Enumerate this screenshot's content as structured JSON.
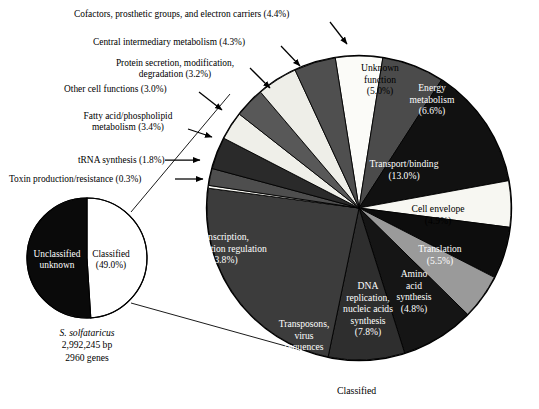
{
  "figure": {
    "background": "#ffffff",
    "bottom_caption": "Classified"
  },
  "small_pie": {
    "center": [
      87,
      258
    ],
    "radius": 60,
    "caption_lines": [
      "S. solfataricus",
      "2,992,245 bp",
      "2960 genes"
    ],
    "organism": "S. solfataricus",
    "genome_size": "2,992,245 bp",
    "gene_count": "2960 genes",
    "slices": [
      {
        "label": "Classified",
        "value_label": "(49.0%)",
        "value": 49.0,
        "color": "#ffffff",
        "text_color": "on-light",
        "label_pos": [
          111,
          249
        ]
      },
      {
        "label": "Unclassified unknown",
        "value_label": "",
        "value": 51.0,
        "color": "#0a0a0a",
        "text_color": "on-dark",
        "label_pos": [
          57,
          249
        ]
      }
    ]
  },
  "chart_data": {
    "type": "pie",
    "title": "",
    "subtitle": "",
    "legend_position": "labels-on-slices",
    "center": [
      359,
      208
    ],
    "radius": 152,
    "start_angle_deg": -9,
    "total_label": "Classified",
    "categories": [
      "Unknown function",
      "Energy metabolism",
      "Transport/binding",
      "Cell envelope",
      "Translation",
      "Amino acid synthesis",
      "DNA replication, nucleic acids synthesis",
      "Transposons, virus sequences",
      "Transcription, transcription regulation",
      "Toxin production/resistance",
      "tRNA synthesis",
      "Fatty acid/phospholipid metabolism",
      "Other cell functions",
      "Protein secretion, modification, degradation",
      "Central intermediary metabolism",
      "Cofactors, prosthetic groups, and electron carriers"
    ],
    "values": [
      5.0,
      6.6,
      13.0,
      4.9,
      5.5,
      4.8,
      7.8,
      8.1,
      23.8,
      0.3,
      1.8,
      3.4,
      3.0,
      3.2,
      4.3,
      4.4
    ],
    "value_labels": [
      "(5.0%)",
      "(6.6%)",
      "(13.0%)",
      "(4.9%)",
      "(5.5%)",
      "(4.8%)",
      "(7.8%)",
      "(8.1%)",
      "(23.8%)",
      "(0.3%)",
      "(1.8%)",
      "(3.4%)",
      "(3.0%)",
      "(3.2%)",
      "(4.3%)",
      "(4.4%)"
    ],
    "colors": [
      "#fbfbf8",
      "#4b4b4b",
      "#111111",
      "#f7f7f2",
      "#0d0d0d",
      "#9a9a9a",
      "#151515",
      "#2e2e2e",
      "#3c3c3c",
      "#f7f7f2",
      "#4e4e4e",
      "#2a2a2a",
      "#efefe9",
      "#585858",
      "#eeeee8",
      "#4f4f4f"
    ],
    "xlabel": "",
    "ylabel": ""
  },
  "inner_labels": [
    {
      "key": "unknown-function",
      "lines": [
        "Unknown",
        "function",
        "(5.0%)"
      ],
      "tone": "on-light",
      "x": 380,
      "y": 62,
      "w": 72
    },
    {
      "key": "energy-metabolism",
      "lines": [
        "Energy",
        "metabolism",
        "(6.6%)"
      ],
      "tone": "on-dark",
      "x": 432,
      "y": 82,
      "w": 70
    },
    {
      "key": "transport-binding",
      "lines": [
        "Transport/binding",
        "(13.0%)"
      ],
      "tone": "on-dark",
      "x": 404,
      "y": 158,
      "w": 112
    },
    {
      "key": "cell-envelope",
      "lines": [
        "Cell envelope",
        "(4.9%)"
      ],
      "tone": "on-light",
      "x": 438,
      "y": 203,
      "w": 84
    },
    {
      "key": "translation",
      "lines": [
        "Translation",
        "(5.5%)"
      ],
      "tone": "on-dark",
      "x": 440,
      "y": 243,
      "w": 76
    },
    {
      "key": "amino-acid-synthesis",
      "lines": [
        "Amino",
        "acid",
        "synthesis",
        "(4.8%)"
      ],
      "tone": "on-dark",
      "x": 414,
      "y": 268,
      "w": 62
    },
    {
      "key": "dna-replication",
      "lines": [
        "DNA",
        "replication,",
        "nucleic acids",
        "synthesis",
        "(7.8%)"
      ],
      "tone": "on-dark",
      "x": 368,
      "y": 280,
      "w": 72
    },
    {
      "key": "transposons-virus",
      "lines": [
        "Transposons,",
        "virus",
        "sequences",
        "(8.1%)"
      ],
      "tone": "on-dark",
      "x": 304,
      "y": 318,
      "w": 70
    },
    {
      "key": "transcription",
      "lines": [
        "Transcription,",
        "transcription regulation",
        "(23.8%)"
      ],
      "tone": "on-dark",
      "x": 222,
      "y": 231,
      "w": 128
    }
  ],
  "callouts": [
    {
      "key": "cofactors",
      "text": "Cofactors, prosthetic groups, and electron carriers (4.4%)",
      "x": 74,
      "y": 9,
      "arrow": {
        "x1": 330,
        "y1": 22,
        "x2": 347,
        "y2": 44
      }
    },
    {
      "key": "central-intermediary-metabolism",
      "text": "Central intermediary metabolism (4.3%)",
      "x": 93,
      "y": 37,
      "arrow": {
        "x1": 281,
        "y1": 46,
        "x2": 300,
        "y2": 66
      }
    },
    {
      "key": "protein-secretion",
      "lines": [
        "Protein secretion, modification,",
        "degradation (3.2%)"
      ],
      "x": 88,
      "y": 58,
      "w": 174,
      "arrow": {
        "x1": 250,
        "y1": 68,
        "x2": 270,
        "y2": 88
      }
    },
    {
      "key": "other-cell-functions",
      "text": "Other cell functions (3.0%)",
      "x": 64,
      "y": 84,
      "arrow": {
        "x1": 199,
        "y1": 92,
        "x2": 222,
        "y2": 110
      }
    },
    {
      "key": "fatty-acid-metabolism",
      "lines": [
        "Fatty acid/phospholipid",
        "metabolism (3.4%)"
      ],
      "x": 62,
      "y": 111,
      "w": 132,
      "arrow": {
        "x1": 188,
        "y1": 129,
        "x2": 212,
        "y2": 137
      }
    },
    {
      "key": "trna-synthesis",
      "text": "tRNA synthesis (1.8%)",
      "x": 78,
      "y": 155,
      "arrow": {
        "x1": 165,
        "y1": 160,
        "x2": 200,
        "y2": 160
      }
    },
    {
      "key": "toxin-production",
      "text": "Toxin production/resistance (0.3%)",
      "x": 9,
      "y": 174,
      "arrow": {
        "x1": 175,
        "y1": 179,
        "x2": 203,
        "y2": 179
      }
    }
  ],
  "connectors": [
    {
      "key": "connector-upper",
      "x1": 131,
      "y1": 212,
      "x2": 230,
      "y2": 94
    },
    {
      "key": "connector-lower",
      "x1": 131,
      "y1": 303,
      "x2": 300,
      "y2": 350
    }
  ]
}
